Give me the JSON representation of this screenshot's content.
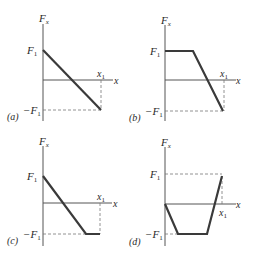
{
  "figure": {
    "panels": [
      {
        "id": "a",
        "tag": "(a)",
        "y_label": "F",
        "y_sub": "x",
        "x_label": "x",
        "x1_label": "x",
        "x1_sub": "1",
        "pos_label": "F",
        "pos_sub": "1",
        "neg_label": "−F",
        "neg_sub": "1",
        "description": "Linear decrease from F1 at x=0 to -F1 at x=x1"
      },
      {
        "id": "b",
        "tag": "(b)",
        "y_label": "F",
        "y_sub": "x",
        "x_label": "x",
        "x1_label": "x",
        "x1_sub": "1",
        "pos_label": "F",
        "pos_sub": "1",
        "neg_label": "−F",
        "neg_sub": "1",
        "description": "Constant F1, then linear decrease to -F1 at x1"
      },
      {
        "id": "c",
        "tag": "(c)",
        "y_label": "F",
        "y_sub": "x",
        "x_label": "x",
        "x1_label": "x",
        "x1_sub": "1",
        "pos_label": "F",
        "pos_sub": "1",
        "neg_label": "−F",
        "neg_sub": "1",
        "description": "Linear decrease from F1 to -F1, then constant -F1 until x1"
      },
      {
        "id": "d",
        "tag": "(d)",
        "y_label": "F",
        "y_sub": "x",
        "x_label": "x",
        "x1_label": "x",
        "x1_sub": "1",
        "pos_label": "F",
        "pos_sub": "1",
        "neg_label": "−F",
        "neg_sub": "1",
        "description": "From 0 drop to -F1, constant, then rise to F1 at x1"
      }
    ],
    "colors": {
      "curve": "#3a3a3a",
      "axis": "#555555",
      "dashed": "#777777"
    }
  }
}
